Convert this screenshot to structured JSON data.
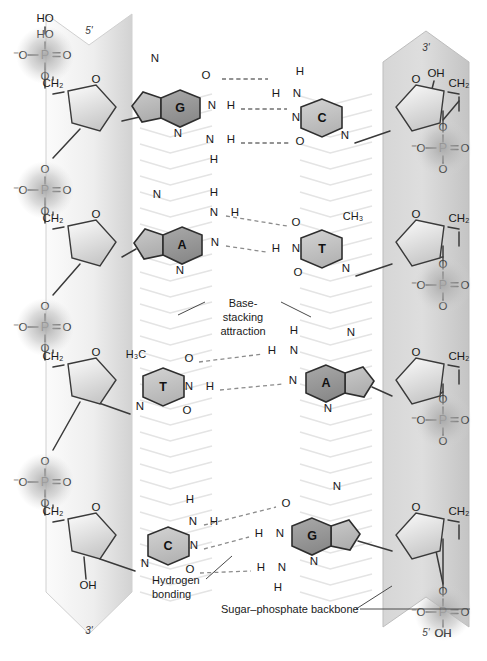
{
  "figure": {
    "strands": [
      {
        "id": "left-strand",
        "five_prime_label": "5'",
        "three_prime_label": "3'",
        "top_end": "five-prime",
        "terminal_group_top": "HO",
        "terminal_group_bottom": "OH",
        "backbone_label": "Sugar–phosphate backbone",
        "phosphates": [
          {
            "o_minus": "⁻O",
            "p": "P",
            "o_double": "O",
            "o_up": "HO",
            "o_down": "O"
          },
          {
            "o_minus": "⁻O",
            "p": "P",
            "o_double": "O",
            "o_up": "O",
            "o_down": "O"
          },
          {
            "o_minus": "⁻O",
            "p": "P",
            "o_double": "O",
            "o_up": "O",
            "o_down": "O"
          },
          {
            "o_minus": "⁻O",
            "p": "P",
            "o_double": "O",
            "o_up": "O",
            "o_down": "O"
          }
        ],
        "sugars": [
          {
            "ch2": "CH₂",
            "ring_o": "O"
          },
          {
            "ch2": "CH₂",
            "ring_o": "O"
          },
          {
            "ch2": "CH₂",
            "ring_o": "O"
          },
          {
            "ch2": "CH₂",
            "ring_o": "O",
            "oh": "OH"
          }
        ]
      },
      {
        "id": "right-strand",
        "five_prime_label": "5'",
        "three_prime_label": "3'",
        "top_end": "three-prime",
        "terminal_group_top": "OH",
        "terminal_group_bottom": "OH",
        "phosphates": [
          {
            "o_minus": "⁻O",
            "p": "P",
            "o_double": "O",
            "o_up": "O",
            "o_down": "O"
          },
          {
            "o_minus": "⁻O",
            "p": "P",
            "o_double": "O",
            "o_up": "O",
            "o_down": "O"
          },
          {
            "o_minus": "⁻O",
            "p": "P",
            "o_double": "O",
            "o_up": "O",
            "o_down": "O"
          },
          {
            "o_minus": "⁻O",
            "p": "P",
            "o_double": "O",
            "o_up": "O",
            "o_down": "OH"
          }
        ],
        "sugars": [
          {
            "ch2": "CH₂",
            "ring_o": "O",
            "oh": "OH"
          },
          {
            "ch2": "CH₂",
            "ring_o": "O"
          },
          {
            "ch2": "CH₂",
            "ring_o": "O"
          },
          {
            "ch2": "CH₂",
            "ring_o": "O"
          }
        ]
      }
    ],
    "base_pairs": [
      {
        "index": 1,
        "left_base": "G",
        "right_base": "C",
        "left_base_type": "purine",
        "right_base_type": "pyrimidine",
        "hydrogen_bonds": 3,
        "bond_atoms": [
          {
            "left": "O",
            "right": "H",
            "right2": "N",
            "right_h_top": "H"
          },
          {
            "left": "N",
            "left_h": "H",
            "right": "N"
          },
          {
            "left": "N",
            "left_h": "H",
            "left_h_lower": "H",
            "right": "O"
          }
        ],
        "left_ring_atoms": [
          "N",
          "N",
          "N",
          "O"
        ],
        "right_ring_atoms": [
          "N",
          "N",
          "O",
          "H"
        ]
      },
      {
        "index": 2,
        "left_base": "A",
        "right_base": "T",
        "left_base_type": "purine",
        "right_base_type": "pyrimidine",
        "hydrogen_bonds": 2,
        "methyl": "CH₃",
        "bond_atoms": [
          {
            "left": "N",
            "left_h": "H",
            "right": "O"
          },
          {
            "left": "N",
            "right": "H",
            "right2": "N"
          }
        ],
        "left_ring_atoms": [
          "N",
          "N",
          "N"
        ],
        "right_ring_atoms": [
          "N",
          "O",
          "O"
        ]
      },
      {
        "index": 3,
        "left_base": "T",
        "right_base": "A",
        "left_base_type": "pyrimidine",
        "right_base_type": "purine",
        "hydrogen_bonds": 2,
        "methyl": "H₃C",
        "bond_atoms": [
          {
            "left": "O",
            "right": "H",
            "right2": "N",
            "right_h_top": "H"
          },
          {
            "left": "N",
            "left_h": "H",
            "right": "N"
          }
        ],
        "left_ring_atoms": [
          "N",
          "O",
          "O"
        ],
        "right_ring_atoms": [
          "N",
          "N",
          "N"
        ]
      },
      {
        "index": 4,
        "left_base": "C",
        "right_base": "G",
        "left_base_type": "pyrimidine",
        "right_base_type": "purine",
        "hydrogen_bonds": 3,
        "bond_atoms": [
          {
            "left": "N",
            "left_h_top": "H",
            "left_h": "H",
            "right": "O"
          },
          {
            "left": "N",
            "right": "H",
            "right2": "N"
          },
          {
            "left": "O",
            "right": "H",
            "right2": "N",
            "right_h_lower": "H"
          }
        ],
        "left_ring_atoms": [
          "N",
          "O",
          "H"
        ],
        "right_ring_atoms": [
          "N",
          "N",
          "N",
          "O"
        ]
      }
    ],
    "annotations": [
      {
        "id": "base-stacking",
        "line1": "Base-",
        "line2": "stacking",
        "line3": "attraction",
        "text": "Base-stacking attraction"
      },
      {
        "id": "hydrogen-bonding",
        "line1": "Hydrogen",
        "line2": "bonding",
        "text": "Hydrogen bonding"
      },
      {
        "id": "sugar-phosphate-backbone",
        "text": "Sugar–phosphate backbone"
      }
    ],
    "colors": {
      "ribbon": "#d9d9d9",
      "ribbon_light": "#f2f2f2",
      "purine_ring": "#9a9a9a",
      "purine_ring_light": "#bdbdbd",
      "pyrimidine_ring": "#c3c3c3",
      "phosphate_halo": "#b3b3b3",
      "bond_line": "#3a3a3a",
      "hbond_dash": "#8c8c8c",
      "stack_chevron": "#e8e8e8",
      "text": "#1a1a1a"
    }
  }
}
